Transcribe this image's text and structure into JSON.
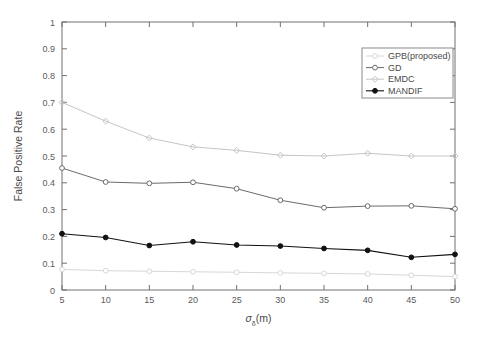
{
  "chart_data": {
    "type": "line",
    "title": "",
    "xlabel": "σₖ(m)",
    "xlabel_base": "σ",
    "xlabel_sub": "δ",
    "xlabel_unit": "(m)",
    "ylabel": "False Positive Rate",
    "x": [
      5,
      10,
      15,
      20,
      25,
      30,
      35,
      40,
      45,
      50
    ],
    "xticklabels": [
      "5",
      "10",
      "15",
      "20",
      "25",
      "30",
      "35",
      "40",
      "45",
      "50"
    ],
    "yticklabels": [
      "0",
      "0.1",
      "0.2",
      "0.3",
      "0.4",
      "0.5",
      "0.6",
      "0.7",
      "0.8",
      "0.9",
      "1"
    ],
    "yticks": [
      0,
      0.1,
      0.2,
      0.3,
      0.4,
      0.5,
      0.6,
      0.7,
      0.8,
      0.9,
      1
    ],
    "xlim": [
      5,
      50
    ],
    "ylim": [
      0,
      1
    ],
    "grid": false,
    "legend_position": "upper right",
    "series": [
      {
        "name": "GPB(proposed)",
        "color": "#d8d8d8",
        "marker": "circle-open",
        "values": [
          0.077,
          0.072,
          0.07,
          0.068,
          0.066,
          0.064,
          0.062,
          0.06,
          0.055,
          0.05
        ]
      },
      {
        "name": "GD",
        "color": "#6b6b6b",
        "marker": "circle-open",
        "values": [
          0.455,
          0.403,
          0.398,
          0.402,
          0.378,
          0.335,
          0.307,
          0.313,
          0.314,
          0.303
        ]
      },
      {
        "name": "EMDC",
        "color": "#c6c6c6",
        "marker": "diamond-open",
        "values": [
          0.7,
          0.63,
          0.567,
          0.534,
          0.521,
          0.503,
          0.5,
          0.51,
          0.5,
          0.5
        ]
      },
      {
        "name": "MANDIF",
        "color": "#111111",
        "marker": "circle-filled",
        "values": [
          0.21,
          0.196,
          0.166,
          0.18,
          0.168,
          0.164,
          0.155,
          0.148,
          0.122,
          0.133
        ]
      }
    ]
  },
  "legend": {
    "items": [
      {
        "label": "GPB(proposed)"
      },
      {
        "label": "GD"
      },
      {
        "label": "EMDC"
      },
      {
        "label": "MANDIF"
      }
    ]
  }
}
